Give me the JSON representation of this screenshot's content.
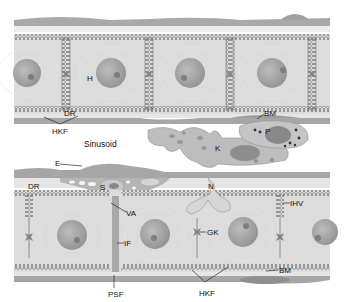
{
  "diagram": {
    "colors": {
      "cytoplasm": "#dcdcdc",
      "nucleus": "#a8a8a8",
      "nucleolus": "#7e7e7e",
      "endothelium": "#a3a3a3",
      "kupffer": "#bdbdbd",
      "membrane": "#777777",
      "background": "#ffffff"
    },
    "labels": {
      "H": "H",
      "DR_top": "DR",
      "HKF_top": "HKF",
      "BM_top": "BM",
      "P": "P",
      "K": "K",
      "sinusoid": "Sinusoid",
      "E": "E",
      "DR_bottom": "DR",
      "S": "S",
      "VA": "VA",
      "N": "N",
      "IHV": "IHV",
      "GK": "GK",
      "IF": "IF",
      "PSF": "PSF",
      "HKF_bottom": "HKF",
      "BM_bottom": "BM"
    }
  }
}
